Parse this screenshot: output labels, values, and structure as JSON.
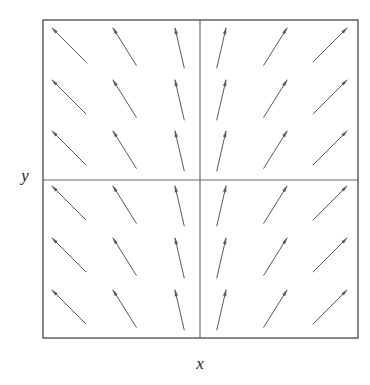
{
  "figure": {
    "type": "direction-field",
    "background_color": "#ffffff",
    "frame": {
      "x": 43,
      "y": 20,
      "width": 315,
      "height": 318,
      "stroke_color": "#555555",
      "stroke_width": 1.4
    },
    "center_axes": {
      "vertical_x": 200,
      "horizontal_y": 180,
      "stroke_color": "#6b6b6b",
      "stroke_width": 1.2
    },
    "arrow_color": "#5a5a5a",
    "arrow_stroke_width": 1.0
  },
  "labels": {
    "x_axis": "x",
    "y_axis": "y"
  },
  "chart_data": {
    "type": "quiver",
    "title": "",
    "xlabel": "x",
    "ylabel": "y",
    "grid": false,
    "legend": null,
    "axis_lines": {
      "x_zero_line": true,
      "y_zero_line": true
    },
    "xlim": [
      -3,
      3
    ],
    "ylim": [
      -3,
      3
    ],
    "grid_columns": 6,
    "grid_rows": 6,
    "x": [
      -2.5,
      -1.5,
      -0.5,
      0.5,
      1.5,
      2.5
    ],
    "y": [
      2.5,
      1.5,
      0.5,
      -0.5,
      -1.5,
      -2.5
    ],
    "column_vectors": [
      {
        "x": -2.5,
        "u": -1.0,
        "v": 1.0,
        "angle_deg": 135,
        "length": 48
      },
      {
        "x": -1.5,
        "u": -0.62,
        "v": 1.0,
        "angle_deg": 122,
        "length": 44
      },
      {
        "x": -0.5,
        "u": -0.22,
        "v": 1.0,
        "angle_deg": 103,
        "length": 41
      },
      {
        "x": 0.5,
        "u": 0.22,
        "v": 1.0,
        "angle_deg": 77,
        "length": 41
      },
      {
        "x": 1.5,
        "u": 0.62,
        "v": 1.0,
        "angle_deg": 58,
        "length": 44
      },
      {
        "x": 2.5,
        "u": 1.0,
        "v": 1.0,
        "angle_deg": 45,
        "length": 48
      }
    ],
    "arrow_tip_x_pixels": [
      52,
      113,
      175,
      226,
      287,
      347
    ],
    "arrow_tip_y_pixels": [
      28,
      80,
      131,
      186,
      238,
      290
    ]
  }
}
